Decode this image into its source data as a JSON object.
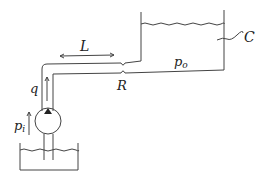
{
  "diagram": {
    "type": "hydraulic pump-pipe-tank schematic",
    "labels": {
      "length": "L",
      "flow": "q",
      "restriction": "R",
      "outlet_pressure_base": "p",
      "outlet_pressure_sub": "o",
      "inlet_pressure_base": "p",
      "inlet_pressure_sub": "i",
      "capacitance": "C"
    },
    "components": [
      {
        "id": "reservoir",
        "description": "open supply reservoir at bottom"
      },
      {
        "id": "pump",
        "description": "pump circle with triangle"
      },
      {
        "id": "pipe",
        "description": "pipe of length L rising then horizontal"
      },
      {
        "id": "restriction",
        "description": "orifice restriction R in pipe"
      },
      {
        "id": "tank",
        "description": "upper tank with capacitance C"
      }
    ],
    "colors": {
      "line": "#333333",
      "background": "#ffffff"
    }
  }
}
